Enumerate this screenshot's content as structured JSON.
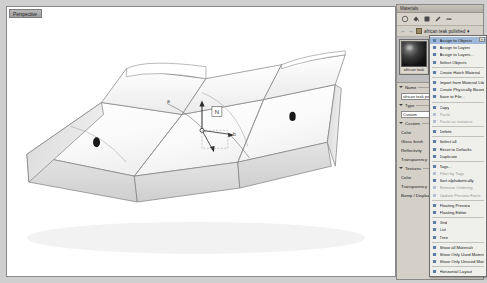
{
  "viewport": {
    "tab_label": "Perspective",
    "annotations": {
      "label_a": "a",
      "label_b": "b",
      "gizmo_label": "N"
    }
  },
  "materials_panel": {
    "title": "Materials",
    "toolbar": [
      {
        "name": "new-material-icon",
        "glyph": "circle"
      },
      {
        "name": "paint-bucket-icon",
        "glyph": "bucket"
      },
      {
        "name": "assign-material-icon",
        "glyph": "assign"
      },
      {
        "name": "edit-material-icon",
        "glyph": "pencil"
      },
      {
        "name": "delete-material-icon",
        "glyph": "minus"
      }
    ],
    "breadcrumb": {
      "back_label": "←",
      "forward_label": "→",
      "path": "african teak polished",
      "dropdown": "▾"
    },
    "selected_material": {
      "name": "african teak",
      "thumbnail": "dark-sphere-preview"
    },
    "sections": [
      {
        "id": "name",
        "label": "Name",
        "open": true,
        "rows": [
          {
            "type": "input",
            "label": "",
            "value": "african teak polished"
          }
        ]
      },
      {
        "id": "type",
        "label": "Type",
        "open": true,
        "rows": [
          {
            "type": "input",
            "label": "",
            "value": "Custom"
          }
        ]
      },
      {
        "id": "custom",
        "label": "Custom",
        "open": true,
        "rows": [
          {
            "type": "color",
            "label": "Color",
            "value": "#6b4a2a"
          },
          {
            "type": "slider",
            "label": "Gloss finish",
            "value": ""
          },
          {
            "type": "slider",
            "label": "Reflectivity",
            "value": ""
          },
          {
            "type": "slider",
            "label": "Transparency",
            "value": ""
          }
        ]
      },
      {
        "id": "textures",
        "label": "Textures",
        "open": true,
        "rows": [
          {
            "type": "texture",
            "label": "Color",
            "value": ""
          },
          {
            "type": "texture",
            "label": "Transparency",
            "value": ""
          },
          {
            "type": "texture",
            "label": "Bump / Displacement",
            "value": ""
          }
        ]
      }
    ]
  },
  "context_menu": {
    "close_label": "×",
    "items": [
      {
        "label": "Assign to Objects",
        "icon": "assign-objects-icon",
        "state": "highlighted"
      },
      {
        "label": "Assign to Layers",
        "icon": "assign-layers-icon",
        "state": "normal"
      },
      {
        "label": "Assign to Layers...",
        "icon": "assign-layers-dialog-icon",
        "state": "normal"
      },
      {
        "label": "Select Objects",
        "icon": "select-objects-icon",
        "state": "normal"
      },
      {
        "separator": true
      },
      {
        "label": "Create Hatch Material",
        "icon": "hatch-material-icon",
        "state": "normal"
      },
      {
        "separator": true
      },
      {
        "label": "Import from Material Library",
        "icon": "import-icon",
        "state": "normal"
      },
      {
        "label": "Create Physically Based",
        "icon": "physically-based-icon",
        "state": "normal"
      },
      {
        "label": "Save to File...",
        "icon": "save-icon",
        "state": "normal"
      },
      {
        "separator": true
      },
      {
        "label": "Copy",
        "icon": "copy-icon",
        "state": "normal"
      },
      {
        "label": "Paste",
        "icon": "paste-icon",
        "state": "disabled"
      },
      {
        "label": "Paste as instance",
        "icon": "paste-instance-icon",
        "state": "disabled"
      },
      {
        "separator": true
      },
      {
        "label": "Delete",
        "icon": "delete-icon",
        "state": "normal"
      },
      {
        "separator": true
      },
      {
        "label": "Select all",
        "icon": "select-all-icon",
        "state": "normal"
      },
      {
        "label": "Reset to Defaults",
        "icon": "reset-icon",
        "state": "normal"
      },
      {
        "label": "Duplicate",
        "icon": "duplicate-icon",
        "state": "normal"
      },
      {
        "separator": true
      },
      {
        "label": "Tags...",
        "icon": "tags-icon",
        "state": "normal"
      },
      {
        "label": "Filter by Tags",
        "icon": "filter-tags-icon",
        "state": "disabled"
      },
      {
        "label": "Sort alphabetically",
        "icon": "sort-icon",
        "state": "normal"
      },
      {
        "label": "Remove Ordering",
        "icon": "remove-ordering-icon",
        "state": "disabled"
      },
      {
        "label": "Update Preview Fonts",
        "icon": "update-preview-icon",
        "state": "disabled"
      },
      {
        "separator": true
      },
      {
        "label": "Floating Preview",
        "icon": "floating-preview-icon",
        "state": "normal"
      },
      {
        "label": "Floating Editor",
        "icon": "floating-editor-icon",
        "state": "normal"
      },
      {
        "separator": true
      },
      {
        "label": "Grid",
        "icon": "grid-view-icon",
        "state": "normal"
      },
      {
        "label": "List",
        "icon": "list-view-icon",
        "state": "normal"
      },
      {
        "label": "Tree",
        "icon": "tree-view-icon",
        "state": "normal"
      },
      {
        "separator": true
      },
      {
        "label": "Show all Materials",
        "icon": "show-all-icon",
        "state": "normal"
      },
      {
        "label": "Show Only Used Materials",
        "icon": "show-used-icon",
        "state": "normal"
      },
      {
        "label": "Show Only Unused Materials",
        "icon": "show-unused-icon",
        "state": "normal"
      },
      {
        "separator": true
      },
      {
        "label": "Horizontal Layout",
        "icon": "horizontal-layout-icon",
        "state": "normal"
      }
    ]
  }
}
